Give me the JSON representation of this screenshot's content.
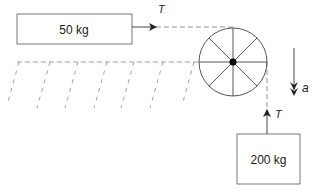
{
  "diagram": {
    "blocks": [
      {
        "id": "block-table",
        "label": "50 kg"
      },
      {
        "id": "block-hanging",
        "label": "200 kg"
      }
    ],
    "forces": [
      {
        "id": "tension-horizontal",
        "label": "T"
      },
      {
        "id": "tension-vertical",
        "label": "T"
      }
    ],
    "acceleration": {
      "label": "a"
    },
    "colors": {
      "stroke": "#333333",
      "dashed": "#777777",
      "hub": "#000000"
    }
  }
}
